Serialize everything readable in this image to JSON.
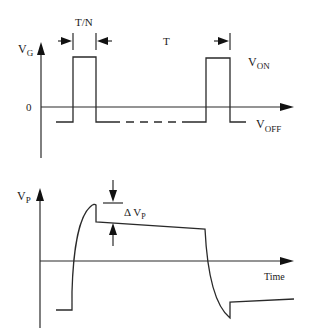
{
  "diagram": {
    "type": "timing-waveform",
    "top_panel": {
      "y_axis_label": "V",
      "y_axis_subscript": "G",
      "zero_label": "0",
      "pulse_width_label": "T/N",
      "period_label": "T",
      "on_level_label": "V",
      "on_level_subscript": "ON",
      "off_level_label": "V",
      "off_level_subscript": "OFF"
    },
    "bottom_panel": {
      "y_axis_label": "V",
      "y_axis_subscript": "P",
      "delta_label": "Δ V",
      "delta_subscript": "P",
      "x_axis_label": "Time"
    },
    "colors": {
      "line": "#2a2a2a",
      "background": "#ffffff"
    }
  }
}
